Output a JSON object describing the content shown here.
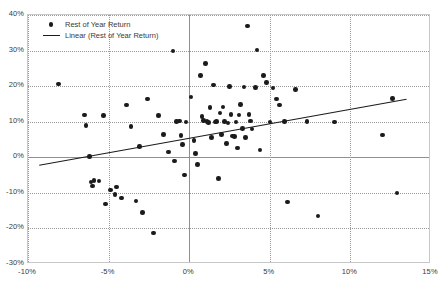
{
  "chart_data": {
    "type": "scatter",
    "title": "",
    "subtitle": "",
    "xlabel": "",
    "ylabel": "",
    "xlim": [
      -10,
      15
    ],
    "ylim": [
      -30,
      40
    ],
    "grid": true,
    "legend_position": "top-left",
    "x_ticks": [
      "-10%",
      "-5%",
      "0%",
      "5%",
      "10%",
      "15%"
    ],
    "x_tick_values": [
      -10,
      -5,
      0,
      5,
      10,
      15
    ],
    "y_ticks": [
      "40%",
      "30%",
      "20%",
      "10%",
      "0%",
      "-10%",
      "-20%",
      "-30%"
    ],
    "y_tick_values": [
      40,
      30,
      20,
      10,
      0,
      -10,
      -20,
      -30
    ],
    "legend": [
      {
        "label": "Rest of Year Return",
        "marker": "dot",
        "color": "#1b1b1b"
      },
      {
        "label": "Linear (Rest of Year Return)",
        "marker": "line",
        "color": "#1b1b1b"
      }
    ],
    "series": [
      {
        "name": "Rest of Year Return",
        "type": "scatter",
        "color": "#1b1b1b",
        "points": [
          [
            -8.1,
            20.6
          ],
          [
            -6.5,
            11.9
          ],
          [
            -6.4,
            9.0
          ],
          [
            -6.2,
            0.2
          ],
          [
            -6.1,
            -6.9
          ],
          [
            -6.0,
            -8.1
          ],
          [
            -5.9,
            -6.6
          ],
          [
            -5.6,
            -6.7
          ],
          [
            -5.3,
            11.7
          ],
          [
            -5.2,
            -13.1
          ],
          [
            -4.9,
            -9.2
          ],
          [
            -4.6,
            -10.4
          ],
          [
            -4.5,
            -8.4
          ],
          [
            -4.2,
            -11.4
          ],
          [
            -3.9,
            14.7
          ],
          [
            -3.6,
            8.6
          ],
          [
            -3.3,
            -12.3
          ],
          [
            -3.1,
            3.0
          ],
          [
            -2.9,
            -15.5
          ],
          [
            -2.6,
            16.4
          ],
          [
            -2.2,
            -21.3
          ],
          [
            -1.9,
            11.7
          ],
          [
            -1.6,
            6.4
          ],
          [
            -1.3,
            1.5
          ],
          [
            -1.0,
            29.9
          ],
          [
            -0.9,
            -1.0
          ],
          [
            -0.8,
            10.0
          ],
          [
            -0.6,
            10.2
          ],
          [
            -0.5,
            6.2
          ],
          [
            -0.4,
            3.6
          ],
          [
            -0.3,
            -5.0
          ],
          [
            -0.2,
            9.9
          ],
          [
            0.1,
            17.0
          ],
          [
            0.3,
            4.8
          ],
          [
            0.4,
            1.1
          ],
          [
            0.5,
            -2.0
          ],
          [
            0.7,
            23.0
          ],
          [
            0.8,
            11.4
          ],
          [
            0.9,
            10.3
          ],
          [
            1.0,
            26.4
          ],
          [
            1.1,
            10.1
          ],
          [
            1.2,
            9.8
          ],
          [
            1.3,
            14.0
          ],
          [
            1.4,
            5.6
          ],
          [
            1.5,
            20.3
          ],
          [
            1.6,
            9.9
          ],
          [
            1.7,
            10.0
          ],
          [
            1.8,
            -5.9
          ],
          [
            1.9,
            12.4
          ],
          [
            2.0,
            6.4
          ],
          [
            2.1,
            14.1
          ],
          [
            2.2,
            10.0
          ],
          [
            2.3,
            3.9
          ],
          [
            2.4,
            9.6
          ],
          [
            2.5,
            19.9
          ],
          [
            2.6,
            12.1
          ],
          [
            2.7,
            6.0
          ],
          [
            2.8,
            5.9
          ],
          [
            2.9,
            9.9
          ],
          [
            3.0,
            2.6
          ],
          [
            3.1,
            11.9
          ],
          [
            3.2,
            14.8
          ],
          [
            3.3,
            8.1
          ],
          [
            3.4,
            19.8
          ],
          [
            3.5,
            5.5
          ],
          [
            3.6,
            36.9
          ],
          [
            3.7,
            12.0
          ],
          [
            3.8,
            10.2
          ],
          [
            3.9,
            8.0
          ],
          [
            4.1,
            19.6
          ],
          [
            4.2,
            30.2
          ],
          [
            4.4,
            2.1
          ],
          [
            4.6,
            23.0
          ],
          [
            4.8,
            21.1
          ],
          [
            5.0,
            9.9
          ],
          [
            5.2,
            19.5
          ],
          [
            5.4,
            16.4
          ],
          [
            5.6,
            14.7
          ],
          [
            5.9,
            10.0
          ],
          [
            6.1,
            -12.6
          ],
          [
            6.6,
            19.0
          ],
          [
            7.3,
            10.0
          ],
          [
            8.0,
            -16.5
          ],
          [
            9.0,
            9.9
          ],
          [
            12.0,
            6.3
          ],
          [
            12.6,
            16.5
          ],
          [
            12.9,
            -10.0
          ]
        ]
      },
      {
        "name": "Linear (Rest of Year Return)",
        "type": "line",
        "color": "#1b1b1b",
        "endpoints": [
          [
            -9.3,
            -2.6
          ],
          [
            13.6,
            16.1
          ]
        ]
      }
    ]
  }
}
